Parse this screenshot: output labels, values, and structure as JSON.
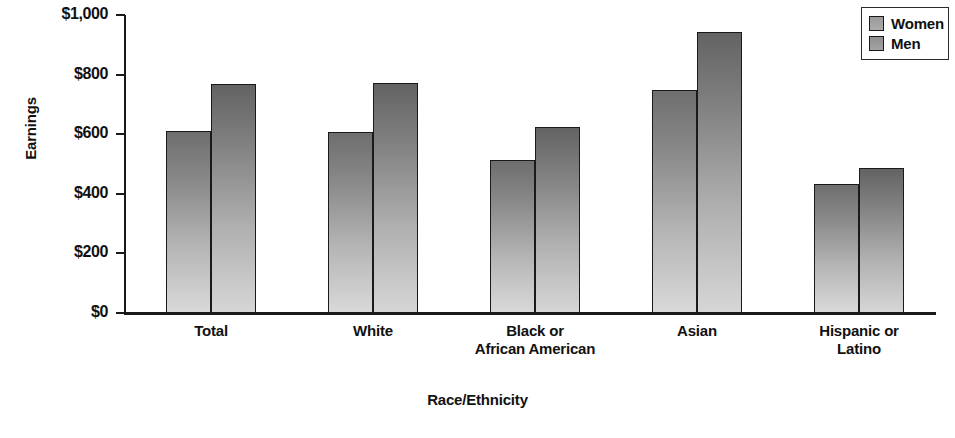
{
  "chart_data": {
    "type": "bar",
    "title": "",
    "xlabel": "Race/Ethnicity",
    "ylabel": "Earnings",
    "categories": [
      "Total",
      "White",
      "Black or\nAfrican American",
      "Asian",
      "Hispanic or\nLatino"
    ],
    "category_labels": [
      {
        "line1": "Total",
        "line2": ""
      },
      {
        "line1": "White",
        "line2": ""
      },
      {
        "line1": "Black or",
        "line2": "African American"
      },
      {
        "line1": "Asian",
        "line2": ""
      },
      {
        "line1": "Hispanic or",
        "line2": "Latino"
      }
    ],
    "series": [
      {
        "name": "Women",
        "values": [
          610,
          608,
          515,
          750,
          433
        ],
        "color": "#8a8a8a"
      },
      {
        "name": "Men",
        "values": [
          770,
          772,
          625,
          943,
          485
        ],
        "color": "#838383"
      }
    ],
    "ylim": [
      0,
      1000
    ],
    "ytick_values": [
      0,
      200,
      400,
      600,
      800,
      1000
    ],
    "ytick_labels": [
      "$0",
      "$200",
      "$400",
      "$600",
      "$800",
      "$1,000"
    ],
    "grid": false,
    "legend_position": "top-right",
    "legend_entries": [
      "Women",
      "Men"
    ]
  },
  "axes": {
    "y_title": "Earnings",
    "x_title": "Race/Ethnicity"
  },
  "legend": {
    "items": [
      {
        "label": "Women"
      },
      {
        "label": "Men"
      }
    ]
  }
}
